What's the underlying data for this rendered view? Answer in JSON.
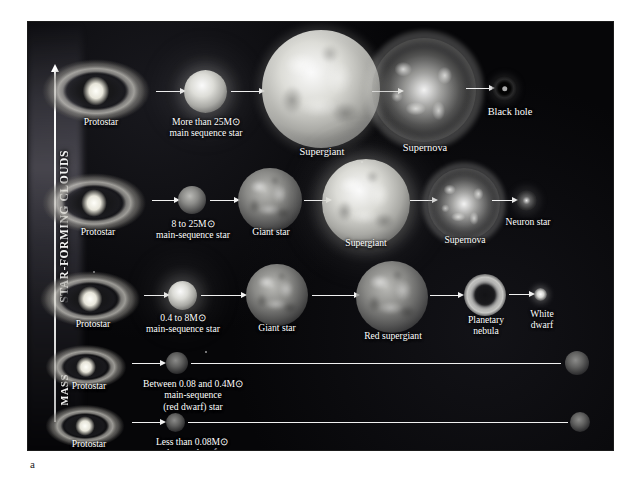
{
  "figure": {
    "label": "a"
  },
  "axes": {
    "vertical_arrow_label": "MASS",
    "vertical_region_label": "STAR-FORMING CLOUDS",
    "horizontal_label": "TIME"
  },
  "tracks": [
    {
      "id": "track-1-high-mass",
      "stages": [
        {
          "name": "protostar",
          "label": "Protostar",
          "type": "protostar"
        },
        {
          "name": "main-sequence-star",
          "label": "More than 25M⊙\nmain sequence star",
          "type": "star"
        },
        {
          "name": "supergiant",
          "label": "Supergiant",
          "type": "star"
        },
        {
          "name": "supernova",
          "label": "Supernova",
          "type": "supernova"
        },
        {
          "name": "black-hole",
          "label": "Black hole",
          "type": "blackhole"
        }
      ]
    },
    {
      "id": "track-2-massive",
      "stages": [
        {
          "name": "protostar",
          "label": "Protostar",
          "type": "protostar"
        },
        {
          "name": "main-sequence-star",
          "label": "8 to 25M⊙\nmain-sequence star",
          "type": "star"
        },
        {
          "name": "giant-star",
          "label": "Giant star",
          "type": "star"
        },
        {
          "name": "supergiant",
          "label": "Supergiant",
          "type": "star"
        },
        {
          "name": "supernova",
          "label": "Supernova",
          "type": "supernova"
        },
        {
          "name": "neutron-star",
          "label": "Neuron star",
          "type": "neutron"
        }
      ]
    },
    {
      "id": "track-3-sunlike",
      "stages": [
        {
          "name": "protostar",
          "label": "Protostar",
          "type": "protostar"
        },
        {
          "name": "main-sequence-star",
          "label": "0.4 to 8M⊙\nmain-sequence star",
          "type": "star"
        },
        {
          "name": "giant-star",
          "label": "Giant star",
          "type": "star"
        },
        {
          "name": "red-supergiant",
          "label": "Red supergiant",
          "type": "star"
        },
        {
          "name": "planetary-nebula",
          "label": "Planetary\nnebula",
          "type": "nebula"
        },
        {
          "name": "white-dwarf",
          "label": "White\ndwarf",
          "type": "whitedwarf"
        }
      ]
    },
    {
      "id": "track-4-red-dwarf",
      "stages": [
        {
          "name": "protostar",
          "label": "Protostar",
          "type": "protostar"
        },
        {
          "name": "main-sequence-star",
          "label": "Between 0.08 and 0.4M⊙\nmain-sequence\n(red dwarf) star",
          "type": "star"
        },
        {
          "name": "end-state-star",
          "label": "",
          "type": "star"
        }
      ]
    },
    {
      "id": "track-5-brown-dwarf",
      "stages": [
        {
          "name": "protostar",
          "label": "Protostar",
          "type": "protostar"
        },
        {
          "name": "brown-dwarf",
          "label": "Less than 0.08M⊙\nbrown dwarf",
          "type": "star"
        },
        {
          "name": "end-state-star",
          "label": "",
          "type": "star"
        }
      ]
    }
  ],
  "colors": {
    "background": "#060608",
    "text": "#ffffff",
    "arrow": "#f1f1f1",
    "page": "#ffffff"
  }
}
